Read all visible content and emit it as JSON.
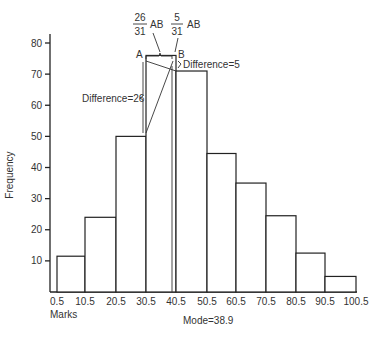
{
  "chart_data": {
    "type": "bar",
    "title": "",
    "xlabel": "Marks",
    "ylabel": "Frequency",
    "ylim": [
      0,
      80
    ],
    "yticks": [
      10,
      20,
      30,
      40,
      50,
      60,
      70,
      80
    ],
    "x_edges": [
      0.5,
      10.5,
      20.5,
      30.5,
      40.5,
      50.5,
      60.5,
      70.5,
      80.5,
      90.5,
      100.5
    ],
    "x_tick_labels": [
      "0.5",
      "10.5",
      "20.5",
      "30.5",
      "40.5",
      "50.5",
      "60.5",
      "70.5",
      "80.5",
      "90.5",
      "100.5"
    ],
    "categories": [
      "0.5-10.5",
      "10.5-20.5",
      "20.5-30.5",
      "30.5-40.5",
      "40.5-50.5",
      "50.5-60.5",
      "60.5-70.5",
      "70.5-80.5",
      "80.5-90.5",
      "90.5-100.5"
    ],
    "values": [
      11.5,
      24,
      50,
      76,
      71,
      44.5,
      35,
      24.5,
      12.5,
      5
    ],
    "grid": false,
    "annotations": {
      "point_a": "A",
      "point_b": "B",
      "fraction_left": {
        "num": "26",
        "den": "31",
        "suffix": "AB"
      },
      "fraction_right": {
        "num": "5",
        "den": "31",
        "suffix": "AB"
      },
      "difference_left": "Difference=26",
      "difference_right": "Difference=5",
      "mode": "Mode=38.9"
    }
  }
}
